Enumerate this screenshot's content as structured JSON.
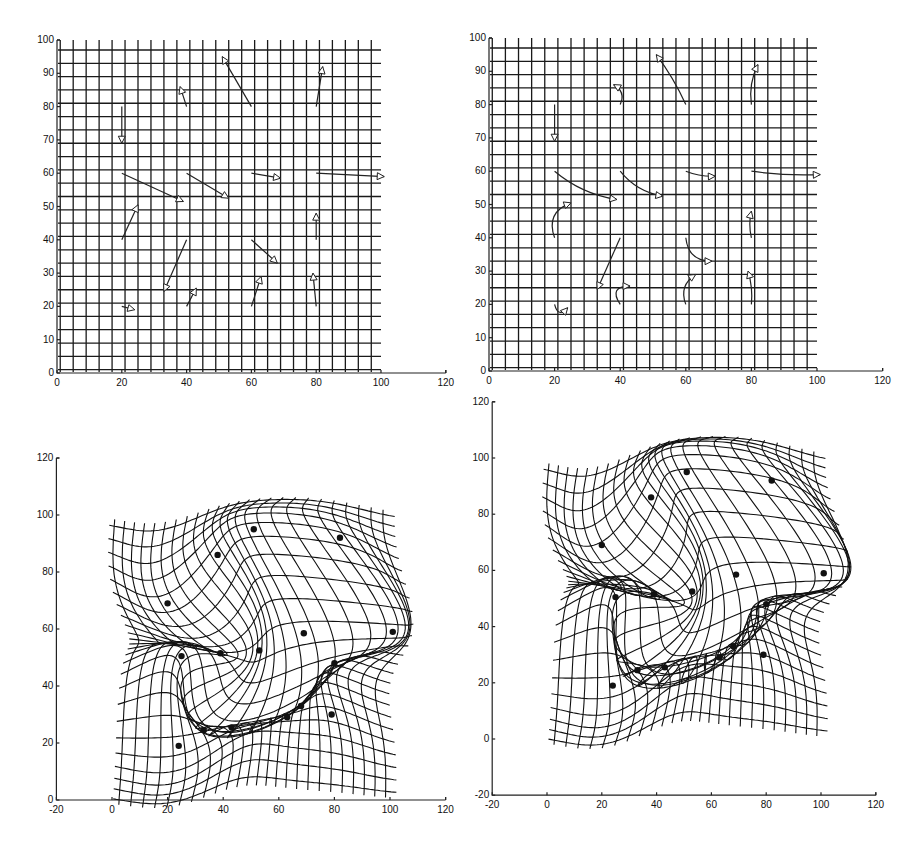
{
  "chart_data": [
    {
      "id": "panel-top-left",
      "type": "line",
      "title": "",
      "description": "Regular grid with straight displacement arrows from source landmarks to target landmarks",
      "xlabel": "",
      "ylabel": "",
      "xlim": [
        0,
        120
      ],
      "ylim": [
        0,
        100
      ],
      "xticks": [
        0,
        20,
        40,
        60,
        80,
        100,
        120
      ],
      "yticks": [
        0,
        10,
        20,
        30,
        40,
        50,
        60,
        70,
        80,
        90,
        100
      ],
      "grid": {
        "x_from": 1,
        "x_to": 100,
        "y_from": 1,
        "y_to": 97,
        "spacing": 4
      },
      "arrow_style": "straight",
      "pixel_frame": {
        "x0": 57,
        "y0": 373,
        "sx": 3.24,
        "sy": 3.33
      }
    },
    {
      "id": "panel-top-right",
      "type": "line",
      "title": "",
      "description": "Regular grid with curved displacement trajectories from source landmarks to target landmarks",
      "xlabel": "",
      "ylabel": "",
      "xlim": [
        0,
        120
      ],
      "ylim": [
        0,
        100
      ],
      "xticks": [
        0,
        20,
        40,
        60,
        80,
        100,
        120
      ],
      "yticks": [
        0,
        10,
        20,
        30,
        40,
        50,
        60,
        70,
        80,
        90,
        100
      ],
      "grid": {
        "x_from": 1,
        "x_to": 100,
        "y_from": 1,
        "y_to": 97,
        "spacing": 4
      },
      "arrow_style": "curved",
      "pixel_frame": {
        "x0": 489,
        "y0": 371,
        "sx": 3.28,
        "sy": 3.33
      }
    },
    {
      "id": "panel-bottom-left",
      "type": "line",
      "title": "",
      "description": "Deformed grid after straight-line landmark warp, landmarks shown as dots",
      "xlabel": "",
      "ylabel": "",
      "xlim": [
        -20,
        120
      ],
      "ylim": [
        0,
        120
      ],
      "xticks": [
        -20,
        0,
        20,
        40,
        60,
        80,
        100,
        120
      ],
      "yticks": [
        0,
        20,
        40,
        60,
        80,
        100,
        120
      ],
      "warp_strength": 1.0,
      "pixel_frame": {
        "x0": 112,
        "y0": 800,
        "sx": 2.78,
        "sy": 2.85
      }
    },
    {
      "id": "panel-bottom-right",
      "type": "line",
      "title": "",
      "description": "Deformed grid after curved-path landmark warp with folding, landmarks shown as dots",
      "xlabel": "",
      "ylabel": "",
      "xlim": [
        -20,
        120
      ],
      "ylim": [
        -20,
        120
      ],
      "xticks": [
        -20,
        0,
        20,
        40,
        60,
        80,
        100,
        120
      ],
      "yticks": [
        -20,
        0,
        20,
        40,
        60,
        80,
        100,
        120
      ],
      "warp_strength": 1.25,
      "pixel_frame": {
        "x0": 547,
        "y0": 739,
        "sx": 2.74,
        "sy": 2.81
      }
    }
  ],
  "landmarks": {
    "source": [
      [
        20,
        80
      ],
      [
        40,
        80
      ],
      [
        60,
        80
      ],
      [
        80,
        80
      ],
      [
        20,
        60
      ],
      [
        40,
        60
      ],
      [
        60,
        60
      ],
      [
        80,
        60
      ],
      [
        20,
        40
      ],
      [
        40,
        40
      ],
      [
        60,
        40
      ],
      [
        80,
        40
      ],
      [
        20,
        20
      ],
      [
        40,
        20
      ],
      [
        60,
        20
      ],
      [
        80,
        20
      ]
    ],
    "target": [
      [
        20,
        69
      ],
      [
        38,
        86
      ],
      [
        51,
        95
      ],
      [
        82,
        92
      ],
      [
        39,
        51.5
      ],
      [
        53,
        52.5
      ],
      [
        69,
        58.5
      ],
      [
        101,
        59
      ],
      [
        25,
        50.5
      ],
      [
        33,
        24.5
      ],
      [
        68,
        33
      ],
      [
        80,
        48
      ],
      [
        24,
        19
      ],
      [
        43,
        25.5
      ],
      [
        63,
        29
      ],
      [
        79,
        30
      ]
    ],
    "curve_bend": [
      0,
      3,
      1,
      -2,
      3,
      3,
      1,
      1,
      -6,
      0,
      5,
      -1,
      4,
      -6,
      -4,
      1
    ]
  }
}
